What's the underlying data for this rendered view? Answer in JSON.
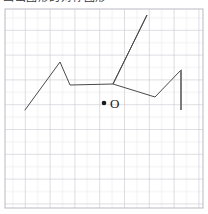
{
  "caption": {
    "text": "画出图形的对称图形",
    "visible_note": "clipped"
  },
  "canvas": {
    "width": 208,
    "height": 214,
    "background": "#ffffff"
  },
  "grid": {
    "x": 5,
    "y": 9,
    "width": 198,
    "height": 199,
    "cell_size": 12.4,
    "minor_color": "#e3e3e8",
    "major_color": "#c9c9d2",
    "border_color": "#b9b9c4",
    "major_every": 2,
    "cols": 16,
    "rows": 16
  },
  "figure": {
    "stroke_color": "#4a4a4a",
    "stroke_width": 1,
    "polyline_points": "25,110 60,62 70,85 113,84 147,15 113,84 155,97 181,70",
    "segments": [
      {
        "name": "lower-left-ray",
        "from": [
          25,
          110
        ],
        "to": [
          60,
          62
        ]
      },
      {
        "name": "left-notch-down",
        "from": [
          60,
          62
        ],
        "to": [
          70,
          85
        ]
      },
      {
        "name": "notch-to-center",
        "from": [
          70,
          85
        ],
        "to": [
          113,
          84
        ]
      },
      {
        "name": "center-to-apex",
        "from": [
          113,
          84
        ],
        "to": [
          147,
          15
        ]
      },
      {
        "name": "apex-to-center",
        "from": [
          147,
          15
        ],
        "to": [
          113,
          84
        ]
      },
      {
        "name": "center-to-right-valley",
        "from": [
          113,
          84
        ],
        "to": [
          155,
          97
        ]
      },
      {
        "name": "right-valley-up",
        "from": [
          155,
          97
        ],
        "to": [
          181,
          70
        ]
      }
    ],
    "vertical_bar": {
      "x": 181,
      "y1": 70,
      "y2": 110,
      "color": "#7a7a7a",
      "width": 2
    }
  },
  "origin_marker": {
    "dot": {
      "cx": 104,
      "cy": 103,
      "r": 2.3,
      "color": "#1a1a1a"
    },
    "label": "O",
    "label_x": 110,
    "label_y": 108
  }
}
